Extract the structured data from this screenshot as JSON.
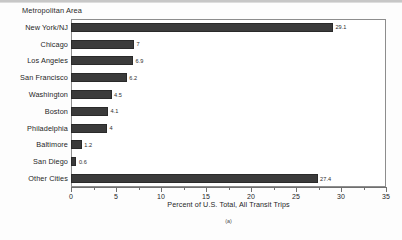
{
  "figure": {
    "group_title": "Metropolitan Area",
    "panel_caption": "(a)"
  },
  "colors": {
    "bar": "#3b3b3b",
    "axis": "#6f6f6f",
    "frame": "#8d8d8d",
    "text": "#1f1f1f",
    "background": "#ffffff"
  },
  "chart_data": {
    "type": "bar",
    "orientation": "horizontal",
    "title": "Metropolitan Area",
    "xlabel": "Percent of U.S. Total, All Transit Trips",
    "ylabel": "Metropolitan Area",
    "xlim": [
      0,
      35
    ],
    "grid": false,
    "legend": null,
    "xticks": [
      0,
      5,
      10,
      15,
      20,
      25,
      30,
      35
    ],
    "xtick_labels": [
      "0",
      "5",
      "10",
      "15",
      "20",
      "25",
      "30",
      "35"
    ],
    "minor_tick_interval": 2.5,
    "categories": [
      "New York/NJ",
      "Chicago",
      "Los Angeles",
      "San Francisco",
      "Washington",
      "Boston",
      "Philadelphia",
      "Baltimore",
      "San Diego",
      "Other Cities"
    ],
    "values": [
      29.1,
      7,
      6.9,
      6.2,
      4.5,
      4.1,
      4,
      1.2,
      0.6,
      27.4
    ],
    "value_labels": [
      "29.1",
      "7",
      "6.9",
      "6.2",
      "4.5",
      "4.1",
      "4",
      "1.2",
      "0.6",
      "27.4"
    ],
    "bars": [
      {
        "label": "New York/NJ",
        "value": 29.1,
        "value_label": "29.1"
      },
      {
        "label": "Chicago",
        "value": 7,
        "value_label": "7"
      },
      {
        "label": "Los Angeles",
        "value": 6.9,
        "value_label": "6.9"
      },
      {
        "label": "San Francisco",
        "value": 6.2,
        "value_label": "6.2"
      },
      {
        "label": "Washington",
        "value": 4.5,
        "value_label": "4.5"
      },
      {
        "label": "Boston",
        "value": 4.1,
        "value_label": "4.1"
      },
      {
        "label": "Philadelphia",
        "value": 4,
        "value_label": "4"
      },
      {
        "label": "Baltimore",
        "value": 1.2,
        "value_label": "1.2"
      },
      {
        "label": "San Diego",
        "value": 0.6,
        "value_label": "0.6"
      },
      {
        "label": "Other Cities",
        "value": 27.4,
        "value_label": "27.4"
      }
    ]
  }
}
